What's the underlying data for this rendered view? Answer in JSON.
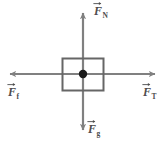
{
  "diagram": {
    "type": "free-body-diagram",
    "canvas": {
      "width": 166,
      "height": 150,
      "background": "#ffffff"
    },
    "colors": {
      "axis_line": "#808080",
      "box_stroke": "#666666",
      "dot": "#1a1a1a",
      "label_text": "#4d4d4d"
    },
    "body": {
      "shape": "rectangle",
      "x": 62,
      "y": 58,
      "width": 42,
      "height": 33,
      "center_dot": {
        "cx": 83,
        "cy": 74,
        "r": 4
      }
    },
    "forces": [
      {
        "name": "normal-force",
        "symbol": "F",
        "subscript": "N",
        "direction": "up",
        "label": "F⃗N",
        "arrow": {
          "x1": 83,
          "y1": 74,
          "x2": 83,
          "y2": 10
        }
      },
      {
        "name": "tension-force",
        "symbol": "F",
        "subscript": "T",
        "direction": "right",
        "label": "F⃗T",
        "arrow": {
          "x1": 83,
          "y1": 74,
          "x2": 159,
          "y2": 74
        }
      },
      {
        "name": "friction-force",
        "symbol": "F",
        "subscript": "f",
        "direction": "left",
        "label": "F⃗f",
        "arrow": {
          "x1": 83,
          "y1": 74,
          "x2": 6,
          "y2": 74
        }
      },
      {
        "name": "gravity-force",
        "symbol": "F",
        "subscript": "g",
        "direction": "down",
        "label": "F⃗g",
        "arrow": {
          "x1": 83,
          "y1": 74,
          "x2": 83,
          "y2": 134
        }
      }
    ]
  }
}
